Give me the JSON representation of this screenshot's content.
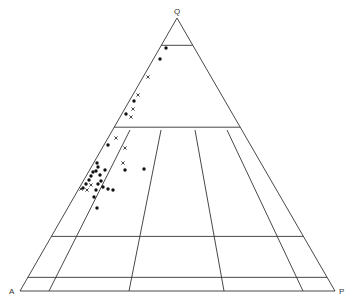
{
  "diagram": {
    "type": "ternary-QAP",
    "vertices": {
      "Q": {
        "label": "Q",
        "x": 177,
        "y": 18
      },
      "A": {
        "label": "A",
        "x": 20,
        "y": 291
      },
      "P": {
        "label": "P",
        "x": 335,
        "y": 291
      }
    },
    "horizontal_lines_q_percent": [
      90,
      60,
      20,
      5
    ],
    "dividing_lines": [
      {
        "x1": 49,
        "y1": 291,
        "x2": 130,
        "y2": 130
      },
      {
        "x1": 129,
        "y1": 291,
        "x2": 161,
        "y2": 130
      },
      {
        "x1": 224,
        "y1": 291,
        "x2": 195,
        "y2": 130
      },
      {
        "x1": 303,
        "y1": 291,
        "x2": 227,
        "y2": 130
      }
    ],
    "points": [
      {
        "m": "dot",
        "x": 166,
        "y": 48
      },
      {
        "m": "dot",
        "x": 160,
        "y": 59
      },
      {
        "m": "x",
        "x": 148,
        "y": 77
      },
      {
        "m": "x",
        "x": 138,
        "y": 95
      },
      {
        "m": "dot",
        "x": 134,
        "y": 101
      },
      {
        "m": "x",
        "x": 133,
        "y": 109
      },
      {
        "m": "dot",
        "x": 126,
        "y": 114
      },
      {
        "m": "x",
        "x": 131,
        "y": 117
      },
      {
        "m": "x",
        "x": 116,
        "y": 138
      },
      {
        "m": "dot",
        "x": 108,
        "y": 145
      },
      {
        "m": "x",
        "x": 125,
        "y": 148
      },
      {
        "m": "x",
        "x": 123,
        "y": 163
      },
      {
        "m": "dot",
        "x": 125,
        "y": 170
      },
      {
        "m": "dot",
        "x": 144,
        "y": 169
      },
      {
        "m": "dot",
        "x": 97,
        "y": 163
      },
      {
        "m": "dot",
        "x": 98,
        "y": 167
      },
      {
        "m": "dot",
        "x": 96,
        "y": 171
      },
      {
        "m": "dot",
        "x": 93,
        "y": 172
      },
      {
        "m": "dot",
        "x": 91,
        "y": 176
      },
      {
        "m": "dot",
        "x": 100,
        "y": 175
      },
      {
        "m": "dot",
        "x": 105,
        "y": 170
      },
      {
        "m": "dot",
        "x": 89,
        "y": 180
      },
      {
        "m": "dot",
        "x": 101,
        "y": 181
      },
      {
        "m": "dot",
        "x": 86,
        "y": 184
      },
      {
        "m": "x",
        "x": 91,
        "y": 185
      },
      {
        "m": "dot",
        "x": 98,
        "y": 184
      },
      {
        "m": "dot",
        "x": 83,
        "y": 188
      },
      {
        "m": "x",
        "x": 87,
        "y": 190
      },
      {
        "m": "dot",
        "x": 96,
        "y": 190
      },
      {
        "m": "dot",
        "x": 103,
        "y": 187
      },
      {
        "m": "dot",
        "x": 108,
        "y": 189
      },
      {
        "m": "dot",
        "x": 113,
        "y": 190
      },
      {
        "m": "dot",
        "x": 94,
        "y": 197
      },
      {
        "m": "dot",
        "x": 97,
        "y": 208
      },
      {
        "m": "x",
        "x": 81,
        "y": 189
      }
    ]
  }
}
